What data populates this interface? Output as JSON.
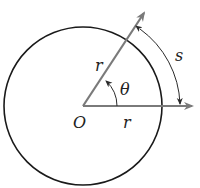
{
  "diagram": {
    "colors": {
      "circle": "#1a1a1a",
      "ray": "#7a7a7a",
      "arc_arrow": "#2a2a2a",
      "text": "#222222",
      "background": "#ffffff"
    },
    "labels": {
      "origin": "O",
      "radius_diagonal": "r",
      "radius_horizontal": "r",
      "angle": "θ",
      "arc_length": "s"
    },
    "geometry": {
      "center": [
        83,
        106
      ],
      "radius": 79,
      "horizontal_ray_end": [
        193,
        106
      ],
      "diagonal_ray_end": [
        145,
        12
      ]
    },
    "icons": {
      "angle_arrow": "curved-arrow-icon",
      "arc_arrow": "double-headed-arc-arrow-icon",
      "ray_arrowhead": "arrowhead-icon"
    }
  }
}
